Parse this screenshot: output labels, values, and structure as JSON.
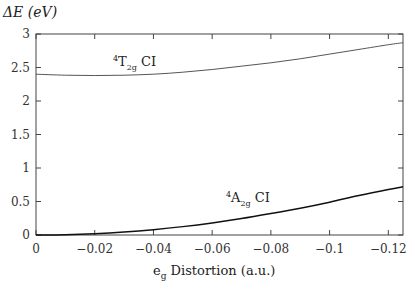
{
  "chart_data": {
    "type": "line",
    "title": "",
    "ylabel": "ΔE (eV)",
    "xlabel": "e_g Distortion (a.u.)",
    "xlim": [
      0,
      -0.125
    ],
    "ylim": [
      0,
      3
    ],
    "grid": false,
    "x_ticks": [
      "0",
      "−0.02",
      "−0.04",
      "−0.06",
      "−0.08",
      "−0.1",
      "−0.12"
    ],
    "y_ticks": [
      "0",
      "0.5",
      "1",
      "1.5",
      "2",
      "2.5",
      "3"
    ],
    "x": [
      0,
      -0.01,
      -0.02,
      -0.03,
      -0.04,
      -0.05,
      -0.06,
      -0.07,
      -0.08,
      -0.09,
      -0.1,
      -0.11,
      -0.12,
      -0.125
    ],
    "series": [
      {
        "name": "4T2g CI",
        "values": [
          2.4,
          2.385,
          2.38,
          2.385,
          2.4,
          2.43,
          2.47,
          2.52,
          2.57,
          2.63,
          2.7,
          2.77,
          2.84,
          2.87
        ]
      },
      {
        "name": "4A2g CI",
        "values": [
          0.0,
          0.005,
          0.02,
          0.045,
          0.08,
          0.125,
          0.18,
          0.245,
          0.32,
          0.4,
          0.49,
          0.59,
          0.68,
          0.72
        ]
      }
    ],
    "annotations": [
      {
        "text": "4T2g CI",
        "near_x": -0.03,
        "near_y": 2.55
      },
      {
        "text": "4A2g CI",
        "near_x": -0.072,
        "near_y": 0.58
      }
    ]
  },
  "labels": {
    "ylabel": "ΔE (eV)",
    "xlabel_main": "e",
    "xlabel_sub": "g",
    "xlabel_rest": " Distortion (a.u.)",
    "t2g_sup": "4",
    "t2g_main": "T",
    "t2g_sub": "2g",
    "t2g_rest": " CI",
    "a2g_sup": "4",
    "a2g_main": "A",
    "a2g_sub": "2g",
    "a2g_rest": " CI"
  }
}
